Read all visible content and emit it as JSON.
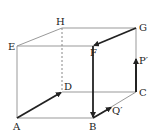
{
  "diagram": {
    "type": "cube",
    "vertices": {
      "A": {
        "label": "A"
      },
      "B": {
        "label": "B"
      },
      "C": {
        "label": "C"
      },
      "D": {
        "label": "D"
      },
      "E": {
        "label": "E"
      },
      "F": {
        "label": "F"
      },
      "G": {
        "label": "G"
      },
      "H": {
        "label": "H"
      }
    },
    "points": {
      "P": {
        "label": "P′"
      },
      "Q": {
        "label": "Q′"
      }
    },
    "vectors": [
      {
        "from": "A",
        "to": "D"
      },
      {
        "from": "G",
        "to": "F"
      },
      {
        "from": "F",
        "to": "B"
      },
      {
        "from": "C",
        "to": "P′"
      },
      {
        "from": "B",
        "to": "Q′"
      }
    ],
    "hidden_edges": [
      "H-D"
    ],
    "colors": {
      "edge": "#999999",
      "vector": "#222222",
      "hidden": "#888888"
    }
  }
}
